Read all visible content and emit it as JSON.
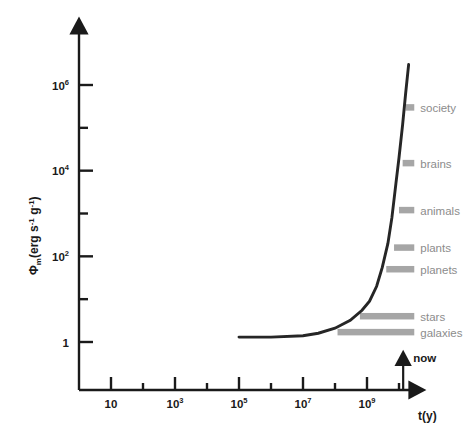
{
  "chart_data": {
    "type": "line",
    "title": "",
    "xlabel": "t(y)",
    "ylabel": "Φm (erg s⁻¹ g⁻¹)",
    "xscale": "log",
    "yscale": "log",
    "xlim": [
      1,
      100000000000.0
    ],
    "ylim": [
      0.1,
      10000000.0
    ],
    "grid": false,
    "legend": "none",
    "xticks": [
      {
        "value": 10,
        "label": "10",
        "mantissa": "10",
        "exponent": "",
        "major": true
      },
      {
        "value": 1000,
        "label": "10³",
        "mantissa": "10",
        "exponent": "3",
        "major": true
      },
      {
        "value": 100000,
        "label": "10⁵",
        "mantissa": "10",
        "exponent": "5",
        "major": true
      },
      {
        "value": 10000000,
        "label": "10⁷",
        "mantissa": "10",
        "exponent": "7",
        "major": true
      },
      {
        "value": 1000000000,
        "label": "10⁹",
        "mantissa": "10",
        "exponent": "9",
        "major": true
      }
    ],
    "xticks_minor": [
      100,
      10000,
      1000000,
      100000000,
      10000000000
    ],
    "yticks": [
      {
        "value": 1000000,
        "label": "10⁶",
        "mantissa": "10",
        "exponent": "6",
        "major": true
      },
      {
        "value": 10000,
        "label": "10⁴",
        "mantissa": "10",
        "exponent": "4",
        "major": true
      },
      {
        "value": 100,
        "label": "10²",
        "mantissa": "10",
        "exponent": "2",
        "major": true
      },
      {
        "value": 1,
        "label": "1",
        "mantissa": "1",
        "exponent": "",
        "major": true
      }
    ],
    "yticks_minor": [
      100000,
      1000,
      10
    ],
    "series": [
      {
        "name": "free energy rate density",
        "color": "#262626",
        "x": [
          100000.0,
          1000000.0,
          10000000.0,
          30000000.0,
          100000000.0,
          300000000.0,
          700000000.0,
          1200000000.0,
          2000000000.0,
          3000000000.0,
          4500000000.0,
          6000000000.0,
          8000000000.0,
          10000000000.0,
          13000000000.0,
          16000000000.0,
          20000000000.0
        ],
        "y": [
          1.3,
          1.3,
          1.4,
          1.6,
          2.1,
          3.2,
          5.5,
          9.0,
          20,
          55,
          200,
          800,
          5000,
          20000,
          120000.0,
          600000.0,
          3000000.0
        ]
      }
    ],
    "annotations": [
      {
        "name": "society",
        "label": "society",
        "y": 300000.0,
        "bar_start_t": 16000000000.0,
        "bar_end_t": 30000000000.0,
        "color": "#a6a6a6"
      },
      {
        "name": "brains",
        "label": "brains",
        "y": 15000.0,
        "bar_start_t": 13000000000.0,
        "bar_end_t": 30000000000.0,
        "color": "#a6a6a6"
      },
      {
        "name": "animals",
        "label": "animals",
        "y": 1200.0,
        "bar_start_t": 10000000000.0,
        "bar_end_t": 30000000000.0,
        "color": "#a6a6a6"
      },
      {
        "name": "plants",
        "label": "plants",
        "y": 160.0,
        "bar_start_t": 7000000000.0,
        "bar_end_t": 30000000000.0,
        "color": "#a6a6a6"
      },
      {
        "name": "planets",
        "label": "planets",
        "y": 50.0,
        "bar_start_t": 4000000000.0,
        "bar_end_t": 30000000000.0,
        "color": "#a6a6a6"
      },
      {
        "name": "stars",
        "label": "stars",
        "y": 4.0,
        "bar_start_t": 600000000.0,
        "bar_end_t": 30000000000.0,
        "color": "#a6a6a6"
      },
      {
        "name": "galaxies",
        "label": "galaxies",
        "y": 1.7,
        "bar_start_t": 120000000.0,
        "bar_end_t": 30000000000.0,
        "color": "#a6a6a6"
      }
    ],
    "markers": [
      {
        "name": "now",
        "label": "now",
        "t": 13500000000.0,
        "type": "up-arrow",
        "color": "#1a1a1a"
      }
    ]
  },
  "axes": {
    "y_axis_title_main": "Φ",
    "y_axis_title_sub": "m",
    "y_axis_title_unit": "(erg s",
    "y_axis_title_exp1": "-1",
    "y_axis_title_mid": " g",
    "y_axis_title_exp2": "-1",
    "y_axis_title_close": ")",
    "x_axis_title": "t(y)"
  },
  "colors": {
    "axis": "#1a1a1a",
    "curve": "#262626",
    "bar": "#a6a6a6",
    "label_gray": "#8c8c8c",
    "background": "#ffffff"
  }
}
